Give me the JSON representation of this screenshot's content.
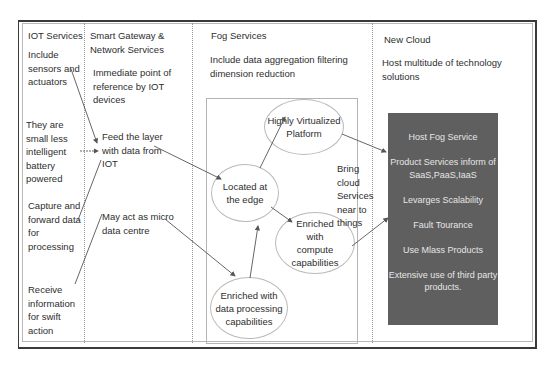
{
  "columns": [
    {
      "title": "IOT Services",
      "items": [
        "Include sensors and actuators",
        "They are small less intelligent battery powered",
        "Capture and forward data for processing",
        "Receive information for swift action"
      ]
    },
    {
      "title": "Smart Gateway & Network Services",
      "items": [
        "Immediate point of reference by IOT devices",
        "Feed the layer with data from IOT",
        "May act as micro data centre"
      ]
    },
    {
      "title": "Fog Services",
      "description": "Include data aggregation filtering dimension reduction",
      "nodes": [
        "Highly Virtualized Platform",
        "Located at the edge",
        "Enriched with compute capabilities",
        "Enriched with data processing capabilities"
      ],
      "side_note": "Bring cloud Services near to things"
    },
    {
      "title": "New Cloud",
      "description": "Host multitude of technology solutions",
      "box_items": [
        "Host Fog Service",
        "Product Services inform of SaaS,PaaS,IaaS",
        "Levarges Scalability",
        "Fault Tourance",
        "Use Mlass Products",
        "Extensive use of third party products."
      ]
    }
  ],
  "colors": {
    "dark_box": "#5f5f5f",
    "dark_box_text": "#e6e6e6",
    "frame": "#3a3a3a",
    "arrow": "#555555"
  }
}
